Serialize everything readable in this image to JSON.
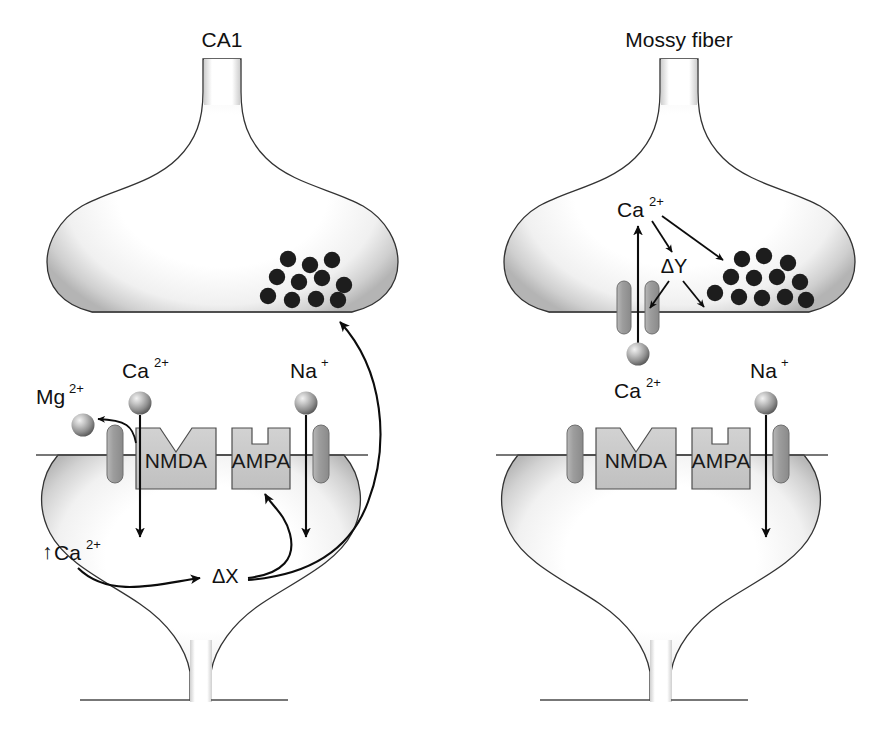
{
  "figure": {
    "background_color": "#ffffff",
    "ink_color": "#111111"
  },
  "colors": {
    "vesicle": "#1d1d1d",
    "receptor_fill": "#c9c9c9",
    "channel_fill": "#a6a6a6",
    "membrane_outline": "#4a4a4a",
    "arrow": "#0c0c0c",
    "terminal_glow": "#bdbdbd"
  },
  "panels": [
    {
      "id": "ca1",
      "title": "CA1",
      "presynaptic": {
        "name": "presynaptic-terminal",
        "vesicle_count": 11,
        "vesicle_label": "synaptic-vesicles"
      },
      "postsynaptic": {
        "name": "dendritic-spine",
        "receptors": [
          {
            "name": "NMDA",
            "notch": "v"
          },
          {
            "name": "AMPA",
            "notch": "square"
          }
        ],
        "channels": 2
      },
      "ions": [
        {
          "id": "mg-out",
          "label": "Mg",
          "charge": "2+",
          "full": "Mg2+",
          "sphere": true
        },
        {
          "id": "ca-in",
          "label": "Ca",
          "charge": "2+",
          "full": "Ca2+",
          "sphere": true
        },
        {
          "id": "na-in",
          "label": "Na",
          "charge": "+",
          "full": "Na+",
          "sphere": true
        }
      ],
      "internal_labels": [
        {
          "id": "ca-rise",
          "text": "Ca",
          "charge": "2+",
          "prefix": "↑",
          "full": "↑Ca2+"
        },
        {
          "id": "delta-x",
          "text": "ΔX",
          "full": "ΔX"
        }
      ],
      "arrows": [
        {
          "id": "mg-expel",
          "from": "channel",
          "to": "Mg2+ outside",
          "style": "curved"
        },
        {
          "id": "ca-influx",
          "from": "Ca2+",
          "to": "↑Ca2+",
          "style": "straight-down"
        },
        {
          "id": "na-influx",
          "from": "Na+",
          "to": "spine interior",
          "style": "straight-down"
        },
        {
          "id": "ca-to-deltax",
          "from": "↑Ca2+",
          "to": "ΔX",
          "style": "curved"
        },
        {
          "id": "deltax-to-ampa",
          "from": "ΔX",
          "to": "AMPA",
          "style": "curved"
        },
        {
          "id": "deltax-retrograde",
          "from": "ΔX",
          "to": "presynaptic terminal",
          "style": "curved-retrograde"
        }
      ]
    },
    {
      "id": "mossy",
      "title": "Mossy fiber",
      "presynaptic": {
        "name": "presynaptic-terminal",
        "vesicle_count": 12,
        "vesicle_label": "synaptic-vesicles",
        "channels": 2,
        "internal_labels": [
          {
            "id": "ca-pre",
            "text": "Ca",
            "charge": "2+",
            "full": "Ca2+"
          },
          {
            "id": "delta-y",
            "text": "ΔY",
            "full": "ΔY"
          }
        ],
        "arrows": [
          {
            "id": "ca-entry",
            "from": "Ca2+ outside",
            "to": "Ca2+ inside",
            "style": "straight-up"
          },
          {
            "id": "ca-to-deltay",
            "from": "Ca2+",
            "to": "ΔY",
            "style": "straight"
          },
          {
            "id": "ca-to-vesicles",
            "from": "Ca2+",
            "to": "vesicles",
            "style": "straight"
          },
          {
            "id": "deltay-to-channel",
            "from": "ΔY",
            "to": "channel",
            "style": "straight"
          },
          {
            "id": "deltay-to-vesicles",
            "from": "ΔY",
            "to": "vesicles",
            "style": "straight"
          }
        ]
      },
      "postsynaptic": {
        "name": "dendritic-spine",
        "receptors": [
          {
            "name": "NMDA",
            "notch": "v"
          },
          {
            "name": "AMPA",
            "notch": "square"
          }
        ],
        "channels": 2
      },
      "ions": [
        {
          "id": "ca-out",
          "label": "Ca",
          "charge": "2+",
          "full": "Ca2+",
          "sphere": true
        },
        {
          "id": "na-in",
          "label": "Na",
          "charge": "+",
          "full": "Na+",
          "sphere": true
        }
      ],
      "arrows": [
        {
          "id": "na-influx",
          "from": "Na+",
          "to": "spine interior",
          "style": "straight-down"
        }
      ]
    }
  ],
  "text": {
    "ca1_title": "CA1",
    "mossy_title": "Mossy fiber",
    "nmda": "NMDA",
    "ampa": "AMPA",
    "mg_base": "Mg",
    "mg_sup": "2+",
    "ca_base": "Ca",
    "ca_sup": "2+",
    "na_base": "Na",
    "na_sup": "+",
    "ca_rise_prefix": "↑",
    "delta_x": "ΔX",
    "delta_y": "ΔY"
  }
}
